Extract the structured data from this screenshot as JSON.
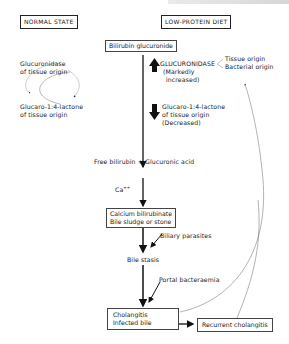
{
  "header_faded_text": "",
  "left_panel": {
    "title": "NORMAL STATE",
    "top_label": [
      "Glucuronidase",
      "of tissue origin"
    ],
    "bottom_label": [
      "Glucaro-1:4-lactone",
      "of tissue origin"
    ]
  },
  "right_panel": {
    "title": "LOW-PROTEIN DIET",
    "bilirubin_glucuronide": "Bilirubin glucuronide",
    "glucuronidase": {
      "label": "GLUCURONIDASE",
      "note": [
        "(Markedly",
        "increased)"
      ],
      "origins": [
        "Tissue origin",
        "Bacterial origin"
      ]
    },
    "lactone": [
      "Glucaro-1:4-lactone",
      "of tissue origin",
      "(Decreased)"
    ],
    "free_bilirubin": "Free bilirubin + Glucuronic acid",
    "calcium_ion": "Ca",
    "calcium_ion_charge": "++",
    "calcium_box": [
      "Calcium bilirubinate",
      "Bile sludge or stone"
    ],
    "biliary_parasites": "Biliary parasites",
    "bile_stasis": "Bile stasis",
    "portal_bacteraemia": "Portal bacteraemia",
    "cholangitis_box": [
      "Cholangitis",
      "Infected bile"
    ],
    "recurrent_box": "Recurrent cholangitis"
  },
  "icons": {
    "up_arrow": "thick-up-arrow",
    "down_arrow": "thick-down-arrow"
  }
}
